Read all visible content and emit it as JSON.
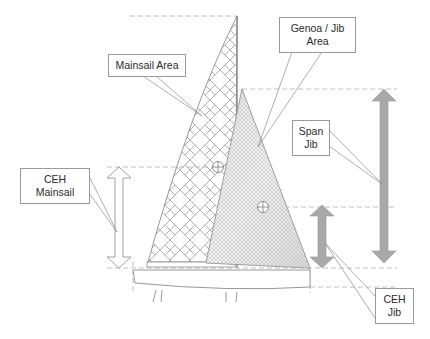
{
  "diagram": {
    "labels": {
      "mainsail_area": "Mainsail Area",
      "genoa_jib_area_line1": "Genoa / Jib",
      "genoa_jib_area_line2": "Area",
      "span_jib_line1": "Span",
      "span_jib_line2": "Jib",
      "ceh_mainsail_line1": "CEH",
      "ceh_mainsail_line2": "Mainsail",
      "ceh_jib_line1": "CEH",
      "ceh_jib_line2": "Jib"
    },
    "colors": {
      "line": "#8c8c8c",
      "dashed": "#b0b0b0",
      "arrow_fill": "#a9a9a9",
      "hollow_arrow": "#ffffff",
      "text": "#2b2b2b"
    },
    "elements": {
      "mainsail": "herringbone-hatched mainsail",
      "jib": "cross-hatched genoa/jib",
      "mainsail_centroid": "centre of effort marker (mainsail)",
      "jib_centroid": "centre of effort marker (jib)",
      "hull": "hull outline with keel lines",
      "span_jib_arrow": "double-headed grey arrow",
      "ceh_jib_arrow": "double-headed grey arrow",
      "ceh_mainsail_arrow": "double-headed hollow arrow"
    }
  }
}
